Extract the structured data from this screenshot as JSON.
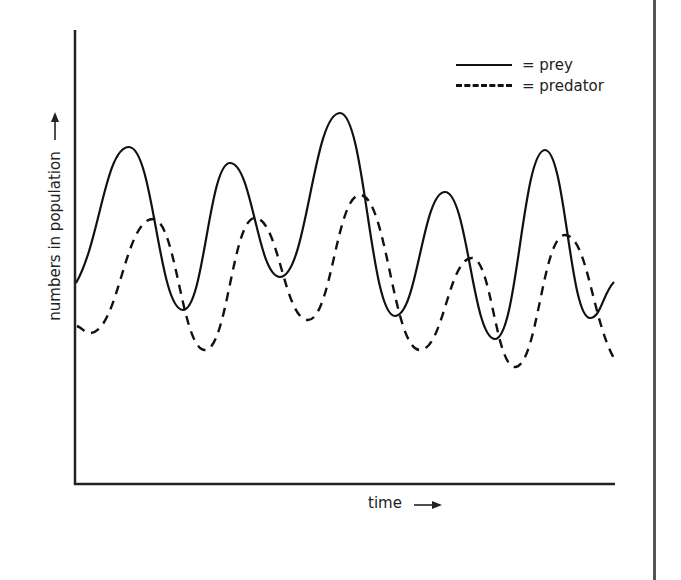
{
  "chart_data": {
    "type": "line",
    "title": "",
    "xlabel": "time",
    "ylabel": "numbers in population",
    "x_axis_arrow": "→",
    "y_axis_arrow": "↑",
    "grid": false,
    "ticks": "none",
    "legend_position": "top-right",
    "legend": [
      {
        "name": "prey",
        "label": "= prey",
        "style": "solid"
      },
      {
        "name": "predator",
        "label": "= predator",
        "style": "dashed"
      }
    ],
    "x": [
      0,
      1,
      2,
      3,
      4,
      5,
      6,
      7,
      8,
      9,
      10,
      11
    ],
    "series": [
      {
        "name": "prey",
        "style": "solid",
        "description": "oscillates with peaks leading predator peaks",
        "points_px": [
          [
            76,
            283
          ],
          [
            129,
            147
          ],
          [
            183,
            310
          ],
          [
            230,
            163
          ],
          [
            280,
            277
          ],
          [
            340,
            113
          ],
          [
            395,
            316
          ],
          [
            445,
            192
          ],
          [
            495,
            339
          ],
          [
            545,
            150
          ],
          [
            590,
            318
          ],
          [
            614,
            282
          ]
        ]
      },
      {
        "name": "predator",
        "style": "dashed",
        "description": "oscillates lagging behind prey, lower amplitude",
        "points_px": [
          [
            77,
            326
          ],
          [
            90,
            333
          ],
          [
            153,
            219
          ],
          [
            205,
            350
          ],
          [
            255,
            218
          ],
          [
            308,
            320
          ],
          [
            360,
            195
          ],
          [
            420,
            350
          ],
          [
            472,
            258
          ],
          [
            515,
            367
          ],
          [
            565,
            235
          ],
          [
            615,
            360
          ]
        ]
      }
    ],
    "relative_peaks": {
      "prey": [
        "high",
        "medium",
        "highest",
        "medium-low",
        "high"
      ],
      "predator": [
        "medium",
        "medium",
        "medium-high",
        "medium-low",
        "medium"
      ]
    }
  },
  "labels": {
    "xlabel": "time",
    "ylabel": "numbers in population",
    "x_arrow": "⟶",
    "y_arrow": "⟶"
  },
  "legend": {
    "prey": "= prey",
    "predator": "= predator"
  }
}
